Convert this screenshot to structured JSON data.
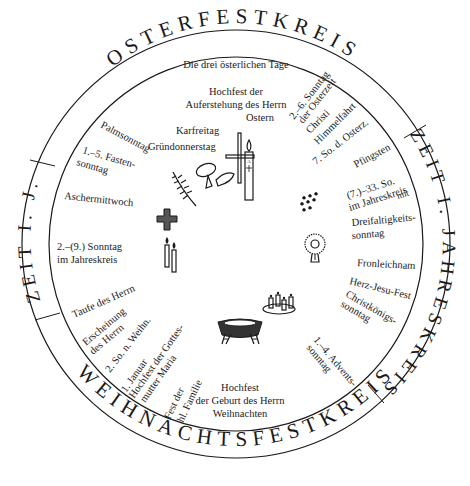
{
  "diagram": {
    "ring": {
      "osterfestkreis": "OSTERFESTKREIS",
      "zeit_jahreskreis_right": "ZEIT I. JAHRESKREIS",
      "zeit_jahreskreis_left": "ZEIT I. J.",
      "weihnachtsfestkreis": "WEIHNACHTSFESTKREIS"
    },
    "labels": {
      "triduum": "Die drei österlichen Tage",
      "ostern_1": "Hochfest der",
      "ostern_2": "Auferstehung des Herrn",
      "ostern_3": "Ostern",
      "karfreitag": "Karfreitag",
      "gruendonnerstag": "Gründonnerstag",
      "palmsonntag": "Palmsonntag",
      "fastensonntag_1": "1.–5. Fasten-",
      "fastensonntag_2": "sonntag",
      "aschermittwoch": "Aschermittwoch",
      "jahreskreis_early_1": "2.–(9.) Sonntag",
      "jahreskreis_early_2": "im Jahreskreis",
      "osterzeit_1": "2.–6. Sonntag",
      "osterzeit_2": "der Osterzeit",
      "himmelfahrt_1": "Christi",
      "himmelfahrt_2": "Himmelfahrt",
      "siebter_sonntag": "7. So. d. Osterz.",
      "pfingsten": "Pfingsten",
      "jahreskreis_late_1": "(7.)–33. So.",
      "jahreskreis_late_2": "im Jahreskreis",
      "jahreskreis_late_3": "mit",
      "dreifaltigkeit_1": "Dreifaltigkeits-",
      "dreifaltigkeit_2": "sonntag",
      "fronleichnam": "Fronleichnam",
      "herz_jesu": "Herz-Jesu-Fest",
      "christkoenig_1": "Christkönigs-",
      "christkoenig_2": "sonntag",
      "advent_1": "1.–4. Advents-",
      "advent_2": "sonntag",
      "weihnachten_1": "Hochfest",
      "weihnachten_2": "der Geburt des Herrn",
      "weihnachten_3": "Weihnachten",
      "hl_familie_1": "Fest der",
      "hl_familie_2": "hl. Familie",
      "neujahr_1": "1. Januar",
      "neujahr_2": "Hochfest der Gottes-",
      "neujahr_3": "mutter Maria",
      "zweiter_so_weihn": "2. So. n. Weihn.",
      "erscheinung_1": "Erscheinung",
      "erscheinung_2": "des Herrn",
      "taufe": "Taufe des Herrn"
    },
    "icons": [
      "easter-candle-icon",
      "cross-icon",
      "chalice-and-bread-icon",
      "palm-branch-icon",
      "ash-cross-icon",
      "candles-icon",
      "pentecost-flames-icon",
      "monstrance-icon",
      "advent-wreath-icon",
      "manger-icon"
    ],
    "colors": {
      "ink": "#1a1a1a",
      "background": "#ffffff"
    }
  }
}
